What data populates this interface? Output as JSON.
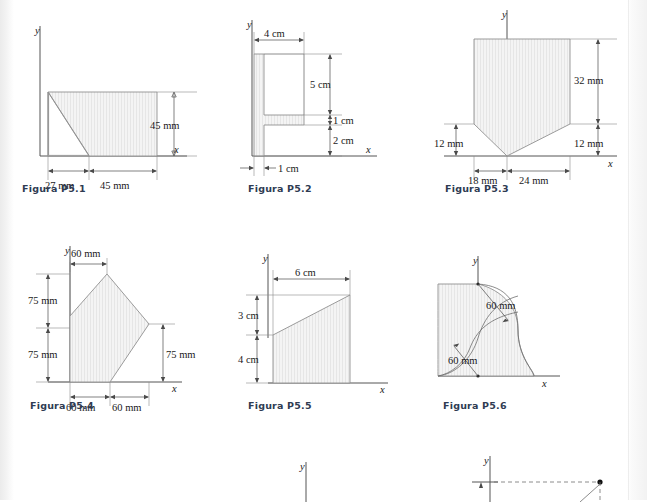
{
  "page": {
    "background": "#ffffff",
    "caption_color": "#2f3b52",
    "shape_fill": "#f2f2f2",
    "shape_stroke": "#909090"
  },
  "figures": [
    {
      "id": "p5-1",
      "caption": "Figura P5.1",
      "axis_x_label": "x",
      "axis_y_label": "y",
      "shape": "rectangle-with-corner-cut",
      "dims": [
        {
          "name": "height",
          "text": "45 mm",
          "value": 45,
          "unit": "mm",
          "orientation": "vertical"
        },
        {
          "name": "left-width",
          "text": "27 mm",
          "value": 27,
          "unit": "mm",
          "orientation": "horizontal"
        },
        {
          "name": "right-width",
          "text": "45 mm",
          "value": 45,
          "unit": "mm",
          "orientation": "horizontal"
        }
      ]
    },
    {
      "id": "p5-2",
      "caption": "Figura P5.2",
      "axis_x_label": "x",
      "axis_y_label": "y",
      "shape": "f-section",
      "dims": [
        {
          "name": "top-arm-length",
          "text": "4 cm",
          "value": 4,
          "unit": "cm",
          "orientation": "horizontal"
        },
        {
          "name": "upper-web-height",
          "text": "5 cm",
          "value": 5,
          "unit": "cm",
          "orientation": "vertical"
        },
        {
          "name": "flange-thickness",
          "text": "1 cm",
          "value": 1,
          "unit": "cm",
          "orientation": "vertical"
        },
        {
          "name": "lower-web-height",
          "text": "2 cm",
          "value": 2,
          "unit": "cm",
          "orientation": "vertical"
        },
        {
          "name": "stem-thickness",
          "text": "1 cm",
          "value": 1,
          "unit": "cm",
          "orientation": "horizontal"
        }
      ]
    },
    {
      "id": "p5-3",
      "caption": "Figura P5.3",
      "axis_x_label": "x",
      "axis_y_label": "y",
      "shape": "shield-pentagon",
      "dims": [
        {
          "name": "upper-height",
          "text": "32 mm",
          "value": 32,
          "unit": "mm",
          "orientation": "vertical"
        },
        {
          "name": "right-lower-height",
          "text": "12 mm",
          "value": 12,
          "unit": "mm",
          "orientation": "vertical"
        },
        {
          "name": "left-lower-height",
          "text": "12 mm",
          "value": 12,
          "unit": "mm",
          "orientation": "vertical"
        },
        {
          "name": "left-width",
          "text": "18 mm",
          "value": 18,
          "unit": "mm",
          "orientation": "horizontal"
        },
        {
          "name": "right-width",
          "text": "24 mm",
          "value": 24,
          "unit": "mm",
          "orientation": "horizontal"
        }
      ]
    },
    {
      "id": "p5-4",
      "caption": "Figura P5.4",
      "axis_x_label": "x",
      "axis_y_label": "y",
      "shape": "pentagon-peak",
      "dims": [
        {
          "name": "apex-offset",
          "text": "60 mm",
          "value": 60,
          "unit": "mm",
          "orientation": "horizontal"
        },
        {
          "name": "upper-height",
          "text": "75 mm",
          "value": 75,
          "unit": "mm",
          "orientation": "vertical"
        },
        {
          "name": "lower-height",
          "text": "75 mm",
          "value": 75,
          "unit": "mm",
          "orientation": "vertical"
        },
        {
          "name": "right-height",
          "text": "75 mm",
          "value": 75,
          "unit": "mm",
          "orientation": "vertical"
        },
        {
          "name": "base-left",
          "text": "60 mm",
          "value": 60,
          "unit": "mm",
          "orientation": "horizontal"
        },
        {
          "name": "base-right",
          "text": "60 mm",
          "value": 60,
          "unit": "mm",
          "orientation": "horizontal"
        }
      ]
    },
    {
      "id": "p5-5",
      "caption": "Figura P5.5",
      "axis_x_label": "x",
      "axis_y_label": "y",
      "shape": "right-trapezoid",
      "dims": [
        {
          "name": "width",
          "text": "6 cm",
          "value": 6,
          "unit": "cm",
          "orientation": "horizontal"
        },
        {
          "name": "upper-rise",
          "text": "3 cm",
          "value": 3,
          "unit": "cm",
          "orientation": "vertical"
        },
        {
          "name": "left-height",
          "text": "4 cm",
          "value": 4,
          "unit": "cm",
          "orientation": "vertical"
        }
      ]
    },
    {
      "id": "p5-6",
      "caption": "Figura P5.6",
      "axis_x_label": "x",
      "axis_y_label": "y",
      "shape": "double-arc-s-curve",
      "dims": [
        {
          "name": "upper-radius",
          "text": "60 mm",
          "value": 60,
          "unit": "mm",
          "orientation": "leader"
        },
        {
          "name": "lower-radius",
          "text": "60 mm",
          "value": 60,
          "unit": "mm",
          "orientation": "leader"
        }
      ]
    },
    {
      "id": "p5-7",
      "caption": "",
      "axis_y_label": "y",
      "shape": "partial-cropped",
      "dims": []
    },
    {
      "id": "p5-8",
      "caption": "",
      "axis_y_label": "y",
      "shape": "partial-cropped-dashed",
      "dims": []
    }
  ]
}
